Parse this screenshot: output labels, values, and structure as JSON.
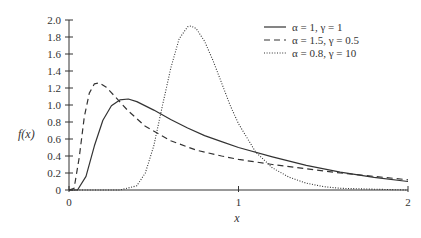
{
  "chart_data": {
    "type": "line",
    "title": "",
    "xlabel": "x",
    "ylabel": "f(x)",
    "xlim": [
      0,
      2
    ],
    "ylim": [
      0,
      2.0
    ],
    "grid": false,
    "legend_position": "upper right",
    "x_ticks": [
      "0",
      "1",
      "2"
    ],
    "y_ticks": [
      "0",
      "0.2",
      "0.4",
      "0.6",
      "0.8",
      "1.0",
      "1.2",
      "1.4",
      "1.6",
      "1.8",
      "2.0"
    ],
    "series": [
      {
        "name": "α = 1, γ = 1",
        "style": "solid",
        "x": [
          0.0,
          0.05,
          0.1,
          0.15,
          0.2,
          0.25,
          0.3,
          0.35,
          0.4,
          0.5,
          0.6,
          0.7,
          0.8,
          0.9,
          1.0,
          1.2,
          1.4,
          1.6,
          1.8,
          2.0
        ],
        "values": [
          0.0,
          0.0,
          0.16,
          0.52,
          0.82,
          0.99,
          1.06,
          1.07,
          1.04,
          0.94,
          0.83,
          0.73,
          0.64,
          0.57,
          0.5,
          0.39,
          0.29,
          0.21,
          0.15,
          0.1
        ]
      },
      {
        "name": "α = 1.5, γ = 0.5",
        "style": "dashed",
        "x": [
          0.0,
          0.03,
          0.06,
          0.09,
          0.12,
          0.15,
          0.18,
          0.22,
          0.28,
          0.35,
          0.45,
          0.6,
          0.75,
          0.9,
          1.0,
          1.2,
          1.4,
          1.6,
          1.8,
          2.0
        ],
        "values": [
          0.0,
          0.02,
          0.38,
          0.86,
          1.14,
          1.25,
          1.26,
          1.21,
          1.08,
          0.93,
          0.75,
          0.58,
          0.47,
          0.4,
          0.36,
          0.3,
          0.25,
          0.2,
          0.16,
          0.12
        ]
      },
      {
        "name": "α = 0.8, γ = 10",
        "style": "dotted",
        "x": [
          0.0,
          0.3,
          0.4,
          0.45,
          0.5,
          0.55,
          0.6,
          0.65,
          0.7,
          0.72,
          0.75,
          0.8,
          0.85,
          0.9,
          0.95,
          1.0,
          1.1,
          1.2,
          1.3,
          1.4,
          1.5,
          1.6,
          1.8,
          2.0
        ],
        "values": [
          0.0,
          0.0,
          0.05,
          0.2,
          0.52,
          0.98,
          1.43,
          1.78,
          1.92,
          1.93,
          1.9,
          1.75,
          1.52,
          1.26,
          1.0,
          0.78,
          0.45,
          0.26,
          0.15,
          0.08,
          0.04,
          0.02,
          0.01,
          0.0
        ]
      }
    ]
  },
  "legend": {
    "items": [
      {
        "label": "α = 1, γ = 1",
        "style": "solid"
      },
      {
        "label": "α = 1.5, γ = 0.5",
        "style": "dashed"
      },
      {
        "label": "α = 0.8, γ = 10",
        "style": "dotted"
      }
    ]
  },
  "colors": {
    "line": "#333333",
    "axis": "#333333",
    "background": "#ffffff"
  }
}
